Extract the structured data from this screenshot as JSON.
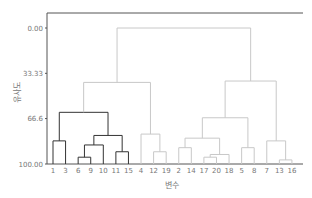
{
  "chart_data": {
    "type": "dendrogram",
    "title": "",
    "xlabel": "변수",
    "ylabel": "유사도",
    "ylim": [
      0.0,
      100.0
    ],
    "y_ticks": [
      "0.00",
      "33.33",
      "66.6",
      "100.00"
    ],
    "y_tick_values": [
      0.0,
      33.33,
      66.6,
      100.0
    ],
    "leaf_order": [
      "1",
      "3",
      "6",
      "9",
      "10",
      "11",
      "15",
      "4",
      "12",
      "19",
      "2",
      "14",
      "17",
      "20",
      "18",
      "5",
      "8",
      "7",
      "13",
      "16"
    ],
    "colors": {
      "highlight_cluster": "#333333",
      "other_clusters": "#c8c8c8",
      "axis": "#555555"
    },
    "merges": [
      {
        "members": [
          "6",
          "9"
        ],
        "similarity": 95,
        "color": "dark"
      },
      {
        "members": [
          "6",
          "9",
          "10"
        ],
        "similarity": 86,
        "color": "dark"
      },
      {
        "members": [
          "11",
          "15"
        ],
        "similarity": 91,
        "color": "dark"
      },
      {
        "members": [
          "6",
          "9",
          "10",
          "11",
          "15"
        ],
        "similarity": 79,
        "color": "dark"
      },
      {
        "members": [
          "1",
          "3"
        ],
        "similarity": 83,
        "color": "dark"
      },
      {
        "members": [
          "1",
          "3",
          "6",
          "9",
          "10",
          "11",
          "15"
        ],
        "similarity": 62,
        "color": "dark"
      },
      {
        "members": [
          "12",
          "19"
        ],
        "similarity": 91,
        "color": "gray"
      },
      {
        "members": [
          "4",
          "12",
          "19"
        ],
        "similarity": 78,
        "color": "gray"
      },
      {
        "members": [
          "1",
          "3",
          "6",
          "9",
          "10",
          "11",
          "15",
          "4",
          "12",
          "19"
        ],
        "similarity": 40,
        "color": "gray"
      },
      {
        "members": [
          "17",
          "20"
        ],
        "similarity": 95,
        "color": "gray"
      },
      {
        "members": [
          "17",
          "20",
          "18"
        ],
        "similarity": 93,
        "color": "gray"
      },
      {
        "members": [
          "2",
          "14"
        ],
        "similarity": 88,
        "color": "gray"
      },
      {
        "members": [
          "2",
          "14",
          "17",
          "20",
          "18"
        ],
        "similarity": 81,
        "color": "gray"
      },
      {
        "members": [
          "5",
          "8"
        ],
        "similarity": 88,
        "color": "gray"
      },
      {
        "members": [
          "2",
          "14",
          "17",
          "20",
          "18",
          "5",
          "8"
        ],
        "similarity": 66,
        "color": "gray"
      },
      {
        "members": [
          "13",
          "16"
        ],
        "similarity": 97,
        "color": "gray"
      },
      {
        "members": [
          "7",
          "13",
          "16"
        ],
        "similarity": 83,
        "color": "gray"
      },
      {
        "members": [
          "2",
          "14",
          "17",
          "20",
          "18",
          "5",
          "8",
          "7",
          "13",
          "16"
        ],
        "similarity": 39,
        "color": "gray"
      },
      {
        "members": [
          "all"
        ],
        "similarity": 0,
        "color": "gray"
      }
    ]
  }
}
